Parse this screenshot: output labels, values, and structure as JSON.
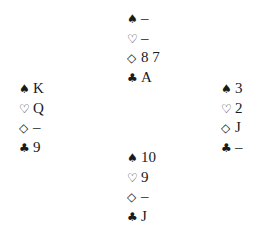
{
  "icons": {
    "spade": "♠",
    "heart": "♡",
    "diamond": "◇",
    "club": "♣"
  },
  "hands": {
    "north": {
      "spades": "–",
      "hearts": "–",
      "diamonds": "8 7",
      "clubs": "A"
    },
    "west": {
      "spades": "K",
      "hearts": "Q",
      "diamonds": "–",
      "clubs": "9"
    },
    "east": {
      "spades": "3",
      "hearts": "2",
      "diamonds": "J",
      "clubs": "–"
    },
    "south": {
      "spades": "10",
      "hearts": "9",
      "diamonds": "–",
      "clubs": "J"
    }
  }
}
